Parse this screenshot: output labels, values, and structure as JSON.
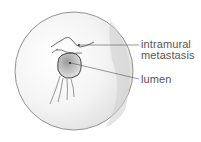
{
  "figure": {
    "type": "endoscopic-view-illustration",
    "labels": [
      {
        "id": "intramural-metastasis",
        "lines": [
          "intramural",
          "metastasis"
        ]
      },
      {
        "id": "lumen",
        "lines": [
          "lumen"
        ]
      }
    ]
  },
  "colors": {
    "outline": "#777777",
    "stroke": "#444444",
    "shading": "#d8d8d8",
    "text": "#555555"
  }
}
